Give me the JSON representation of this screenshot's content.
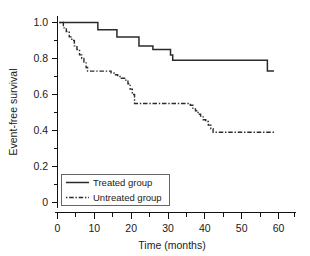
{
  "chart_data": {
    "type": "line",
    "title": "",
    "subtitle": "",
    "xlabel": "Time (months)",
    "ylabel": "Event-free survival",
    "xlim": [
      0,
      65
    ],
    "ylim": [
      0,
      1.06
    ],
    "xticks": [
      0,
      10,
      20,
      30,
      40,
      50,
      60
    ],
    "xtick_labels": [
      "0",
      "10",
      "20",
      "30",
      "40",
      "50",
      "60"
    ],
    "xminor_ticks": [
      5,
      15,
      25,
      35,
      45,
      55,
      65
    ],
    "yticks": [
      0,
      0.2,
      0.4,
      0.6,
      0.8,
      1.0
    ],
    "ytick_labels": [
      "0",
      "0.2",
      "0.4",
      "0.6",
      "0.8",
      "1.0"
    ],
    "yminor_ticks": [
      0.1,
      0.3,
      0.5,
      0.7,
      0.9
    ],
    "grid": false,
    "legend_position": "lower-left",
    "step_type": "post",
    "series": [
      {
        "name": "Treated group",
        "linestyle": "solid",
        "color": "#2b2b2b",
        "x": [
          0.5,
          11.0,
          16.2,
          22.2,
          26.0,
          30.8,
          31.4,
          57.2,
          59.0
        ],
        "y": [
          1.0,
          0.96,
          0.92,
          0.87,
          0.85,
          0.82,
          0.79,
          0.73,
          0.73
        ]
      },
      {
        "name": "Untreated group",
        "linestyle": "dashdot",
        "color": "#2b2b2b",
        "x": [
          0.5,
          1.6,
          2.4,
          3.2,
          3.9,
          4.6,
          5.3,
          6.0,
          6.6,
          7.2,
          7.8,
          8.2,
          13.4,
          14.6,
          15.4,
          16.4,
          17.4,
          18.6,
          19.2,
          19.8,
          20.4,
          21.0,
          35.2,
          36.2,
          36.9,
          37.6,
          38.3,
          39.0,
          39.7,
          40.4,
          41.1,
          41.8,
          42.4,
          59.2
        ],
        "y": [
          1.0,
          0.97,
          0.95,
          0.92,
          0.9,
          0.87,
          0.85,
          0.82,
          0.8,
          0.78,
          0.75,
          0.73,
          0.73,
          0.72,
          0.71,
          0.7,
          0.69,
          0.68,
          0.66,
          0.63,
          0.6,
          0.55,
          0.55,
          0.54,
          0.52,
          0.51,
          0.49,
          0.48,
          0.46,
          0.45,
          0.43,
          0.41,
          0.39,
          0.39
        ]
      }
    ]
  },
  "legend": {
    "entries": [
      {
        "label": "Treated group",
        "style": "solid"
      },
      {
        "label": "Untreated group",
        "style": "dashdot"
      }
    ]
  },
  "colors": {
    "axis": "#111111",
    "series": "#2b2b2b",
    "background": "#ffffff",
    "legend_border": "#555555"
  }
}
